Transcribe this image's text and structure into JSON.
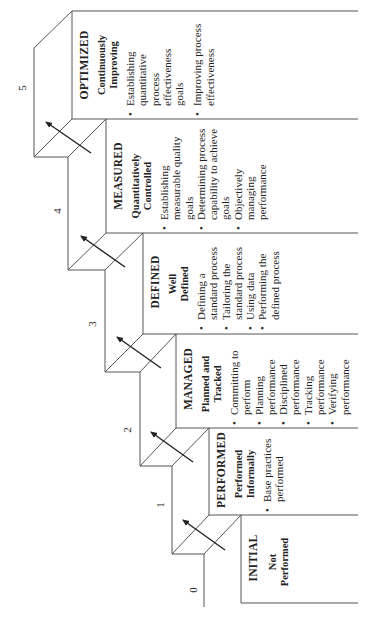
{
  "diagram": {
    "type": "staircase-maturity-levels",
    "orientation": "rotated-90-ccw",
    "line_color": "#555555",
    "arrow_color": "#222222",
    "levels": [
      {
        "number": "0",
        "name": "INITIAL",
        "subtitle": "Not Performed",
        "practices": []
      },
      {
        "number": "1",
        "name": "PERFORMED",
        "subtitle": "Performed Informally",
        "practices": [
          "Base practices performed"
        ]
      },
      {
        "number": "2",
        "name": "MANAGED",
        "subtitle": "Planned and Tracked",
        "practices": [
          "Committing to perform",
          "Planning performance",
          "Disciplined performance",
          "Tracking performance",
          "Verifying performance"
        ]
      },
      {
        "number": "3",
        "name": "DEFINED",
        "subtitle": "Well Defined",
        "practices": [
          "Defining a standard process",
          "Tailoring the standard process",
          "Using data",
          "Performing the defined process"
        ]
      },
      {
        "number": "4",
        "name": "MEASURED",
        "subtitle": "Quantitatively Controlled",
        "practices": [
          "Establishing measurable quality goals",
          "Determining process capability to achieve goals",
          "Objectively managing performance"
        ]
      },
      {
        "number": "5",
        "name": "OPTIMIZED",
        "subtitle": "Continuously Improving",
        "practices": [
          "Establishing quantitative process effectiveness goals",
          "Improving process effectiveness"
        ]
      }
    ]
  }
}
